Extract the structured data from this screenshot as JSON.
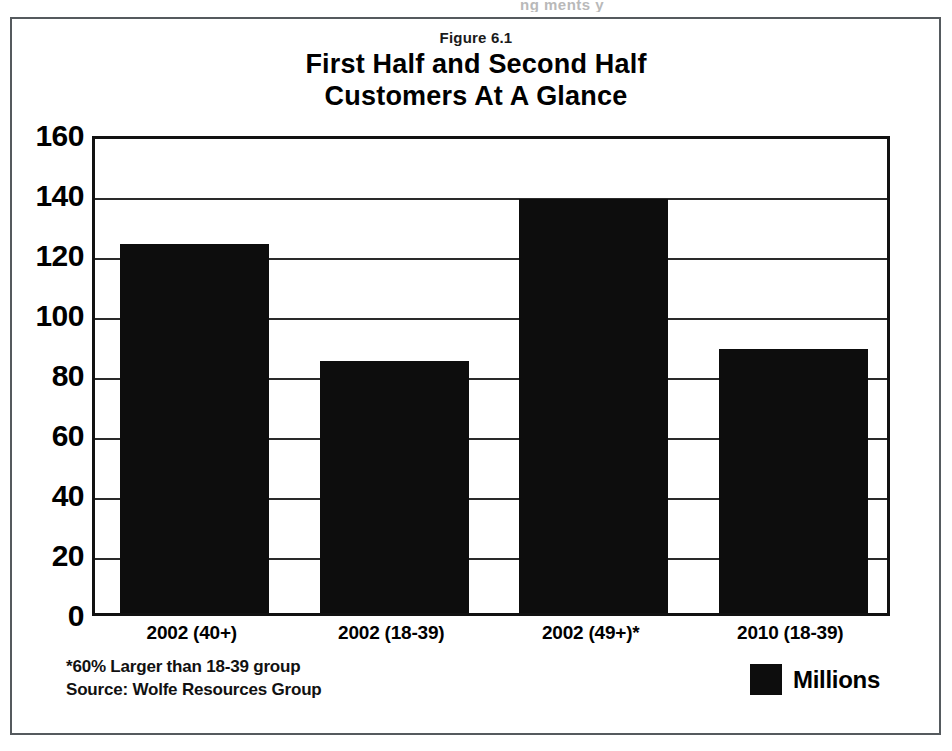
{
  "figure": {
    "figure_label": "Figure 6.1",
    "title_line1": "First Half and Second Half",
    "title_line2": "Customers At A Glance",
    "artifact_text": "ng     ments y"
  },
  "notes": {
    "line1": "*60% Larger than 18-39 group",
    "line2": "Source: Wolfe Resources Group"
  },
  "legend": {
    "series_label": "Millions",
    "swatch_color": "#0d0d0d"
  },
  "chart_data": {
    "type": "bar",
    "title": "First Half and Second Half Customers At A Glance",
    "subtitle": "Figure 6.1",
    "categories": [
      "2002 (40+)",
      "2002 (18-39)",
      "2002 (49+)*",
      "2010 (18-39)"
    ],
    "values": [
      123,
      84,
      138,
      88
    ],
    "series": [
      {
        "name": "Millions",
        "values": [
          123,
          84,
          138,
          88
        ],
        "color": "#0d0d0d"
      }
    ],
    "xlabel": "",
    "ylabel": "",
    "ylim": [
      0,
      160
    ],
    "yticks": [
      0,
      20,
      40,
      60,
      80,
      100,
      120,
      140,
      160
    ],
    "ytick_labels": [
      "0",
      "20",
      "40",
      "60",
      "80",
      "100",
      "120",
      "140",
      "160"
    ],
    "grid": true,
    "grid_axis": "y",
    "legend_position": "bottom-right",
    "annotations": [
      "*60% Larger than 18-39 group",
      "Source: Wolfe Resources Group"
    ]
  }
}
